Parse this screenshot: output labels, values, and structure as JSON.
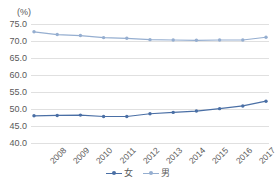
{
  "chart_data": {
    "type": "line",
    "title": "",
    "subtitle": "",
    "xlabel": "",
    "ylabel": "",
    "unit_label": "(%)",
    "categories": [
      "2008",
      "2009",
      "2010",
      "2011",
      "2012",
      "2013",
      "2014",
      "2015",
      "2016",
      "2017",
      "2018"
    ],
    "x": [
      2008,
      2009,
      2010,
      2011,
      2012,
      2013,
      2014,
      2015,
      2016,
      2017,
      2018
    ],
    "ylim": [
      40.0,
      75.0
    ],
    "ytick_step": 5.0,
    "ytick_labels": [
      "75.0",
      "70.0",
      "65.0",
      "60.0",
      "55.0",
      "50.0",
      "45.0",
      "40.0"
    ],
    "ytick_values": [
      75.0,
      70.0,
      65.0,
      60.0,
      55.0,
      50.0,
      45.0,
      40.0
    ],
    "grid": true,
    "grid_axis": "y",
    "legend_position": "bottom",
    "markers": true,
    "series": [
      {
        "name": "女",
        "color": "#4a6fa5",
        "values": [
          48.0,
          48.1,
          48.2,
          47.8,
          47.8,
          48.6,
          49.0,
          49.4,
          50.1,
          50.9,
          52.3
        ]
      },
      {
        "name": "男",
        "color": "#95aed0",
        "values": [
          72.7,
          71.9,
          71.6,
          71.0,
          70.8,
          70.4,
          70.3,
          70.2,
          70.3,
          70.3,
          71.1
        ]
      }
    ]
  },
  "colors": {
    "grid": "#e0e0e0",
    "text": "#595959",
    "background": "#ffffff",
    "series_female": "#4a6fa5",
    "series_male": "#95aed0"
  }
}
